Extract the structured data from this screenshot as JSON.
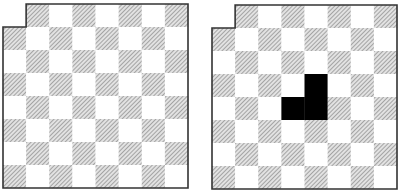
{
  "figure": {
    "grid": {
      "rows": 8,
      "cols": 8
    },
    "removed_cells": [
      [
        0,
        0
      ]
    ],
    "hatched_rule": "(row + col) odd",
    "colors": {
      "hatch": "#8a8a8a",
      "light": "#ffffff",
      "border": "#333333",
      "tromino": "#000000"
    },
    "boards": [
      {
        "id": "left",
        "label": "deficient-board",
        "filled_cells": []
      },
      {
        "id": "right",
        "label": "deficient-board-with-tromino",
        "filled_cells": [
          [
            3,
            4
          ],
          [
            4,
            3
          ],
          [
            4,
            4
          ]
        ]
      }
    ]
  }
}
